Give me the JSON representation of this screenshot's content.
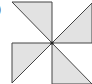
{
  "figure": {
    "label": ")",
    "colors": {
      "fill": "#e2e2e2",
      "stroke": "#444444",
      "center_dot": "#222222"
    }
  }
}
